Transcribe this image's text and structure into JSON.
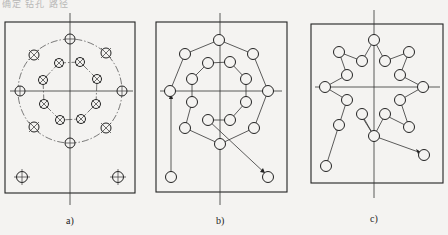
{
  "header_text": "确定 钻孔 路径",
  "panels": [
    {
      "id": "a",
      "label": "a)",
      "description": "Hole layout: two concentric rings of holes plus two corner holes",
      "frame": {
        "x": 5,
        "y": 22,
        "w": 130,
        "h": 171
      },
      "center": {
        "x": 70,
        "y": 91
      },
      "outer_circle_radius": 52,
      "inner_circle_radius": 30
    },
    {
      "id": "b",
      "label": "b)",
      "description": "Drilling path option 1: inner ring then outer ring, then corner holes"
    },
    {
      "id": "c",
      "label": "c)",
      "description": "Drilling path option 2: star-shaped zig-zag between rings, then corner holes"
    }
  ],
  "colors": {
    "line": "#222222",
    "background": "#f4f3f1"
  }
}
